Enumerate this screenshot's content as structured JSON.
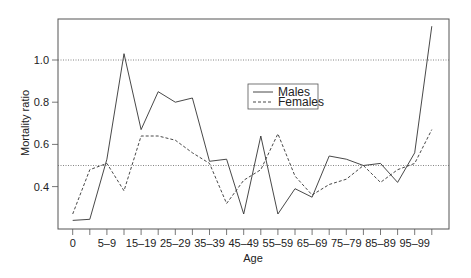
{
  "chart_data": {
    "type": "line",
    "title": "",
    "xlabel": "Age",
    "ylabel": "Mortality ratio",
    "ylim": [
      0.18,
      1.19
    ],
    "yticks": [
      0.4,
      0.6,
      0.8,
      1.0
    ],
    "ytick_labels": [
      "0.4",
      "0.6",
      "0.8",
      "1.0"
    ],
    "reference_lines": [
      0.5,
      1.0
    ],
    "grid": false,
    "legend_position": "upper center",
    "categories": [
      "0",
      "1–4",
      "5–9",
      "10–14",
      "15–19",
      "20–24",
      "25–29",
      "30–34",
      "35–39",
      "40–44",
      "45–49",
      "50–54",
      "55–59",
      "60–64",
      "65–69",
      "70–74",
      "75–79",
      "80–84",
      "85–89",
      "90–94",
      "95–99",
      "100+"
    ],
    "xtick_labels_shown": [
      "0",
      "5–9",
      "15–19",
      "25–29",
      "35–39",
      "45–49",
      "55–59",
      "65–69",
      "75–79",
      "85–89",
      "95–99"
    ],
    "series": [
      {
        "name": "Males",
        "style": "solid",
        "values": [
          0.24,
          0.245,
          0.53,
          1.03,
          0.67,
          0.85,
          0.8,
          0.82,
          0.52,
          0.53,
          0.27,
          0.64,
          0.27,
          0.39,
          0.35,
          0.545,
          0.53,
          0.5,
          0.51,
          0.42,
          0.56,
          1.16
        ]
      },
      {
        "name": "Females",
        "style": "dashed",
        "values": [
          0.27,
          0.48,
          0.51,
          0.38,
          0.64,
          0.64,
          0.62,
          0.56,
          0.51,
          0.32,
          0.43,
          0.48,
          0.65,
          0.45,
          0.36,
          0.41,
          0.435,
          0.5,
          0.42,
          0.48,
          0.51,
          0.67
        ]
      }
    ]
  },
  "legend": {
    "males_label": "Males",
    "females_label": "Females"
  },
  "colors": {
    "line": "#333333",
    "axis": "#555555",
    "reference": "#666666"
  }
}
